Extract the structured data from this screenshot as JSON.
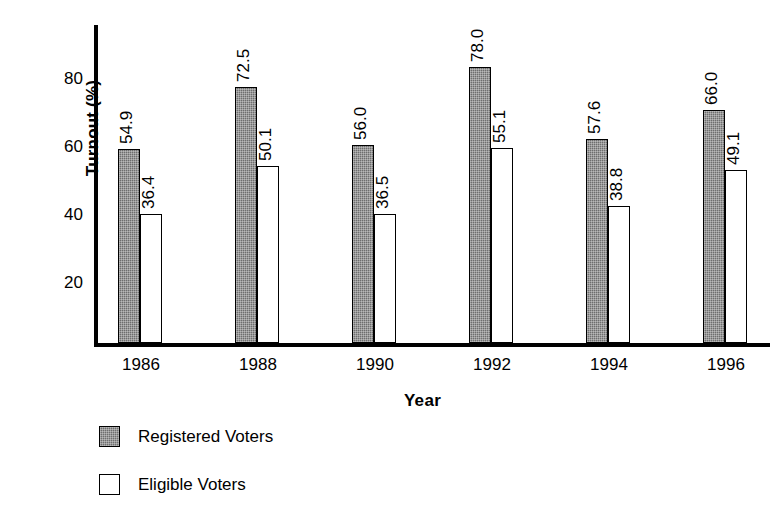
{
  "chart_data": {
    "type": "bar",
    "title": "",
    "xlabel": "Year",
    "ylabel": "Turnout (%)",
    "categories": [
      "1986",
      "1988",
      "1990",
      "1992",
      "1994",
      "1996"
    ],
    "series": [
      {
        "name": "Registered Voters",
        "color": "#6e6e6e",
        "values": [
          54.9,
          72.5,
          56.0,
          78.0,
          57.6,
          66.0
        ],
        "labels": [
          "54.9",
          "72.5",
          "56.0",
          "78.0",
          "57.6",
          "66.0"
        ]
      },
      {
        "name": "Eligible Voters",
        "color": "#ffffff",
        "values": [
          36.4,
          50.1,
          36.5,
          55.1,
          38.8,
          49.1
        ],
        "labels": [
          "36.4",
          "50.1",
          "36.5",
          "55.1",
          "38.8",
          "49.1"
        ]
      }
    ],
    "ylim": [
      0,
      90
    ],
    "yticks": [
      20,
      40,
      60,
      80
    ],
    "ytick_labels": [
      "20",
      "40",
      "60",
      "80"
    ],
    "grid": false,
    "legend_position": "bottom-left",
    "value_labels_rotated": true
  },
  "axes": {
    "y_title": "Turnout (%)",
    "x_title": "Year"
  },
  "legend": {
    "items": [
      {
        "label": "Registered Voters",
        "swatch": "registered"
      },
      {
        "label": "Eligible Voters",
        "swatch": "eligible"
      }
    ]
  }
}
